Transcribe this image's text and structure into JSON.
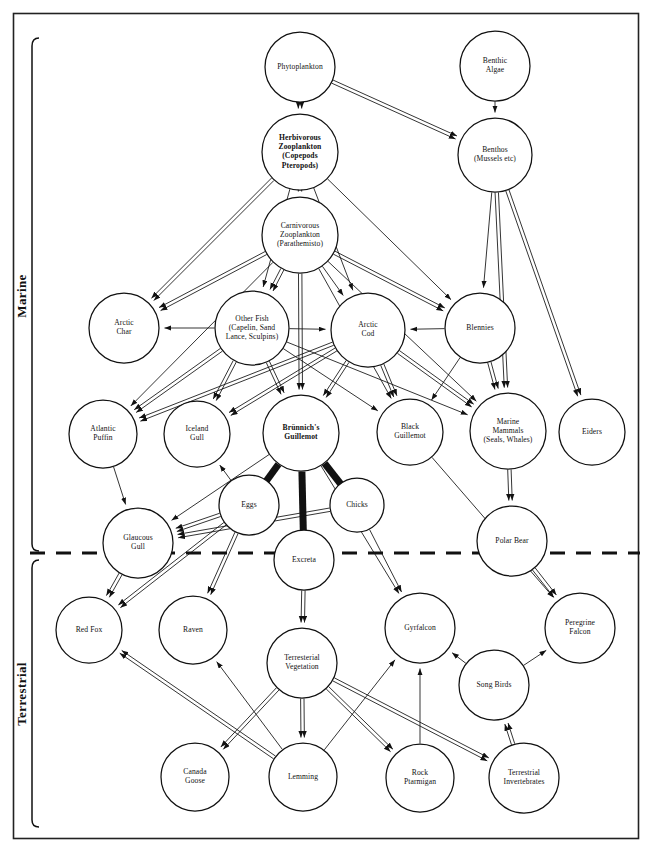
{
  "diagram": {
    "zones": [
      {
        "id": "marine",
        "label": "Marine"
      },
      {
        "id": "terrestrial",
        "label": "Terrestrial"
      }
    ],
    "divider_label": "",
    "colors": {
      "stroke": "#111111",
      "background": "#ffffff",
      "frame": "#222222"
    }
  },
  "nodes": [
    {
      "id": "phytoplankton",
      "label": "Phytoplankton",
      "lines": [
        "Phytoplankton"
      ],
      "cx": 300,
      "cy": 67,
      "r": 35,
      "zone": "marine",
      "bold": false
    },
    {
      "id": "benthic-algae",
      "label": "Benthic Algae",
      "lines": [
        "Benthic",
        "Algae"
      ],
      "cx": 495,
      "cy": 66,
      "r": 35,
      "zone": "marine",
      "bold": false
    },
    {
      "id": "herbivorous-zooplankton",
      "label": "Herbivorous Zooplankton (Copepods Pteropods)",
      "lines": [
        "Herbivorous",
        "Zooplankton",
        "(Copepods",
        "Pteropods)"
      ],
      "cx": 300,
      "cy": 152,
      "r": 38,
      "zone": "marine",
      "bold": true
    },
    {
      "id": "benthos",
      "label": "Benthos (Mussels etc)",
      "lines": [
        "Benthos",
        "(Mussels etc)"
      ],
      "cx": 495,
      "cy": 155,
      "r": 37,
      "zone": "marine",
      "bold": false
    },
    {
      "id": "carnivorous-zooplankton",
      "label": "Carnivorous Zooplankton (Parathemisto)",
      "lines": [
        "Carnivorous",
        "Zooplankton",
        "(Parathemisto)"
      ],
      "cx": 300,
      "cy": 235,
      "r": 38,
      "zone": "marine",
      "bold": false
    },
    {
      "id": "arctic-char",
      "label": "Arctic Char",
      "lines": [
        "Arctic",
        "Char"
      ],
      "cx": 124,
      "cy": 328,
      "r": 35,
      "zone": "marine",
      "bold": false
    },
    {
      "id": "other-fish",
      "label": "Other Fish (Capelin, Sand Lance, Sculpins)",
      "lines": [
        "Other Fish",
        "(Capelin, Sand",
        "Lance, Sculpins)"
      ],
      "cx": 252,
      "cy": 328,
      "r": 37,
      "zone": "marine",
      "bold": false
    },
    {
      "id": "arctic-cod",
      "label": "Arctic Cod",
      "lines": [
        "Arctic",
        "Cod"
      ],
      "cx": 368,
      "cy": 330,
      "r": 37,
      "zone": "marine",
      "bold": false
    },
    {
      "id": "blennies",
      "label": "Blennies",
      "lines": [
        "Blennies"
      ],
      "cx": 480,
      "cy": 328,
      "r": 35,
      "zone": "marine",
      "bold": false
    },
    {
      "id": "atlantic-puffin",
      "label": "Atlantic Puffin",
      "lines": [
        "Atlantic",
        "Puffin"
      ],
      "cx": 103,
      "cy": 434,
      "r": 34,
      "zone": "marine",
      "bold": false
    },
    {
      "id": "iceland-gull",
      "label": "Iceland Gull",
      "lines": [
        "Iceland",
        "Gull"
      ],
      "cx": 197,
      "cy": 434,
      "r": 33,
      "zone": "marine",
      "bold": false
    },
    {
      "id": "brunnichs-guillemot",
      "label": "Brünnich's Guillemot",
      "lines": [
        "Brünnich's",
        "Guillemot"
      ],
      "cx": 301,
      "cy": 433,
      "r": 38,
      "zone": "marine",
      "bold": true
    },
    {
      "id": "black-guillemot",
      "label": "Black Guillemot",
      "lines": [
        "Black",
        "Guillemot"
      ],
      "cx": 410,
      "cy": 432,
      "r": 33,
      "zone": "marine",
      "bold": false
    },
    {
      "id": "marine-mammals",
      "label": "Marine Mammals (Seals, Whales)",
      "lines": [
        "Marine",
        "Mammals",
        "(Seals, Whales)"
      ],
      "cx": 508,
      "cy": 431,
      "r": 38,
      "zone": "marine",
      "bold": false
    },
    {
      "id": "eiders",
      "label": "Eiders",
      "lines": [
        "Eiders"
      ],
      "cx": 592,
      "cy": 432,
      "r": 33,
      "zone": "marine",
      "bold": false
    },
    {
      "id": "eggs",
      "label": "Eggs",
      "lines": [
        "Eggs"
      ],
      "cx": 249,
      "cy": 505,
      "r": 30,
      "zone": "marine",
      "bold": false
    },
    {
      "id": "chicks",
      "label": "Chicks",
      "lines": [
        "Chicks"
      ],
      "cx": 357,
      "cy": 505,
      "r": 27,
      "zone": "marine",
      "bold": false
    },
    {
      "id": "glaucous-gull",
      "label": "Glaucous Gull",
      "lines": [
        "Glaucous",
        "Gull"
      ],
      "cx": 138,
      "cy": 543,
      "r": 35,
      "zone": "marine",
      "bold": false
    },
    {
      "id": "polar-bear",
      "label": "Polar Bear",
      "lines": [
        "Polar Bear"
      ],
      "cx": 512,
      "cy": 541,
      "r": 35,
      "zone": "marine",
      "bold": false
    },
    {
      "id": "excreta",
      "label": "Excreta",
      "lines": [
        "Excreta"
      ],
      "cx": 304,
      "cy": 560,
      "r": 30,
      "zone": "marine",
      "bold": false
    },
    {
      "id": "red-fox",
      "label": "Red Fox",
      "lines": [
        "Red Fox"
      ],
      "cx": 89,
      "cy": 630,
      "r": 33,
      "zone": "terrestrial",
      "bold": false
    },
    {
      "id": "raven",
      "label": "Raven",
      "lines": [
        "Raven"
      ],
      "cx": 193,
      "cy": 630,
      "r": 34,
      "zone": "terrestrial",
      "bold": false
    },
    {
      "id": "gyrfalcon",
      "label": "Gyrfalcon",
      "lines": [
        "Gyrfalcon"
      ],
      "cx": 420,
      "cy": 628,
      "r": 35,
      "zone": "terrestrial",
      "bold": false
    },
    {
      "id": "peregrine-falcon",
      "label": "Peregrine Falcon",
      "lines": [
        "Peregrine",
        "Falcon"
      ],
      "cx": 580,
      "cy": 628,
      "r": 35,
      "zone": "terrestrial",
      "bold": false
    },
    {
      "id": "terresterial-vegetation",
      "label": "Terresterial Vegetation",
      "lines": [
        "Terresterial",
        "Vegetation"
      ],
      "cx": 302,
      "cy": 663,
      "r": 35,
      "zone": "terrestrial",
      "bold": false
    },
    {
      "id": "song-birds",
      "label": "Song Birds",
      "lines": [
        "Song Birds"
      ],
      "cx": 494,
      "cy": 685,
      "r": 35,
      "zone": "terrestrial",
      "bold": false
    },
    {
      "id": "canada-goose",
      "label": "Canada Goose",
      "lines": [
        "Canada",
        "Goose"
      ],
      "cx": 195,
      "cy": 777,
      "r": 34,
      "zone": "terrestrial",
      "bold": false
    },
    {
      "id": "lemming",
      "label": "Lemming",
      "lines": [
        "Lemming"
      ],
      "cx": 303,
      "cy": 777,
      "r": 34,
      "zone": "terrestrial",
      "bold": false
    },
    {
      "id": "rock-ptarmigan",
      "label": "Rock Ptarmigan",
      "lines": [
        "Rock",
        "Ptarmigan"
      ],
      "cx": 420,
      "cy": 778,
      "r": 34,
      "zone": "terrestrial",
      "bold": false
    },
    {
      "id": "terrestrial-invertebrates",
      "label": "Terrestrial Invertebrates",
      "lines": [
        "Terrestrial",
        "Invertebrates"
      ],
      "cx": 524,
      "cy": 778,
      "r": 35,
      "zone": "terrestrial",
      "bold": false
    }
  ],
  "edges": [
    {
      "from": "phytoplankton",
      "to": "herbivorous-zooplankton",
      "style": "double"
    },
    {
      "from": "phytoplankton",
      "to": "benthos",
      "style": "double"
    },
    {
      "from": "benthic-algae",
      "to": "benthos",
      "style": "single"
    },
    {
      "from": "herbivorous-zooplankton",
      "to": "carnivorous-zooplankton",
      "style": "double"
    },
    {
      "from": "herbivorous-zooplankton",
      "to": "arctic-char",
      "style": "double"
    },
    {
      "from": "herbivorous-zooplankton",
      "to": "other-fish",
      "style": "single"
    },
    {
      "from": "herbivorous-zooplankton",
      "to": "arctic-cod",
      "style": "single"
    },
    {
      "from": "herbivorous-zooplankton",
      "to": "blennies",
      "style": "single"
    },
    {
      "from": "benthos",
      "to": "blennies",
      "style": "single"
    },
    {
      "from": "benthos",
      "to": "marine-mammals",
      "style": "double"
    },
    {
      "from": "benthos",
      "to": "eiders",
      "style": "double"
    },
    {
      "from": "carnivorous-zooplankton",
      "to": "arctic-char",
      "style": "double"
    },
    {
      "from": "carnivorous-zooplankton",
      "to": "other-fish",
      "style": "double"
    },
    {
      "from": "carnivorous-zooplankton",
      "to": "arctic-cod",
      "style": "single"
    },
    {
      "from": "carnivorous-zooplankton",
      "to": "blennies",
      "style": "double"
    },
    {
      "from": "carnivorous-zooplankton",
      "to": "brunnichs-guillemot",
      "style": "double"
    },
    {
      "from": "carnivorous-zooplankton",
      "to": "black-guillemot",
      "style": "single"
    },
    {
      "from": "carnivorous-zooplankton",
      "to": "atlantic-puffin",
      "style": "single"
    },
    {
      "from": "carnivorous-zooplankton",
      "to": "marine-mammals",
      "style": "single"
    },
    {
      "from": "other-fish",
      "to": "arctic-char",
      "style": "single"
    },
    {
      "from": "other-fish",
      "to": "arctic-cod",
      "style": "single"
    },
    {
      "from": "blennies",
      "to": "arctic-cod",
      "style": "single"
    },
    {
      "from": "other-fish",
      "to": "atlantic-puffin",
      "style": "double"
    },
    {
      "from": "other-fish",
      "to": "iceland-gull",
      "style": "double"
    },
    {
      "from": "other-fish",
      "to": "brunnichs-guillemot",
      "style": "double"
    },
    {
      "from": "other-fish",
      "to": "black-guillemot",
      "style": "single"
    },
    {
      "from": "other-fish",
      "to": "marine-mammals",
      "style": "single"
    },
    {
      "from": "arctic-cod",
      "to": "atlantic-puffin",
      "style": "double"
    },
    {
      "from": "arctic-cod",
      "to": "iceland-gull",
      "style": "double"
    },
    {
      "from": "arctic-cod",
      "to": "brunnichs-guillemot",
      "style": "double"
    },
    {
      "from": "arctic-cod",
      "to": "black-guillemot",
      "style": "double"
    },
    {
      "from": "arctic-cod",
      "to": "marine-mammals",
      "style": "double"
    },
    {
      "from": "blennies",
      "to": "black-guillemot",
      "style": "single"
    },
    {
      "from": "blennies",
      "to": "marine-mammals",
      "style": "double"
    },
    {
      "from": "brunnichs-guillemot",
      "to": "eggs",
      "style": "thick"
    },
    {
      "from": "brunnichs-guillemot",
      "to": "chicks",
      "style": "thick"
    },
    {
      "from": "brunnichs-guillemot",
      "to": "excreta",
      "style": "thick"
    },
    {
      "from": "brunnichs-guillemot",
      "to": "glaucous-gull",
      "style": "single"
    },
    {
      "from": "brunnichs-guillemot",
      "to": "gyrfalcon",
      "style": "single"
    },
    {
      "from": "atlantic-puffin",
      "to": "glaucous-gull",
      "style": "single"
    },
    {
      "from": "eggs",
      "to": "glaucous-gull",
      "style": "double"
    },
    {
      "from": "eggs",
      "to": "iceland-gull",
      "style": "single"
    },
    {
      "from": "eggs",
      "to": "red-fox",
      "style": "double"
    },
    {
      "from": "eggs",
      "to": "raven",
      "style": "double"
    },
    {
      "from": "chicks",
      "to": "glaucous-gull",
      "style": "double"
    },
    {
      "from": "chicks",
      "to": "gyrfalcon",
      "style": "single"
    },
    {
      "from": "glaucous-gull",
      "to": "red-fox",
      "style": "double"
    },
    {
      "from": "marine-mammals",
      "to": "polar-bear",
      "style": "double"
    },
    {
      "from": "black-guillemot",
      "to": "peregrine-falcon",
      "style": "single"
    },
    {
      "from": "polar-bear",
      "to": "peregrine-falcon",
      "style": "double"
    },
    {
      "from": "excreta",
      "to": "terresterial-vegetation",
      "style": "double"
    },
    {
      "from": "terresterial-vegetation",
      "to": "lemming",
      "style": "double"
    },
    {
      "from": "terresterial-vegetation",
      "to": "canada-goose",
      "style": "double"
    },
    {
      "from": "terresterial-vegetation",
      "to": "rock-ptarmigan",
      "style": "double"
    },
    {
      "from": "terresterial-vegetation",
      "to": "terrestrial-invertebrates",
      "style": "double"
    },
    {
      "from": "lemming",
      "to": "red-fox",
      "style": "double"
    },
    {
      "from": "lemming",
      "to": "raven",
      "style": "single"
    },
    {
      "from": "lemming",
      "to": "gyrfalcon",
      "style": "single"
    },
    {
      "from": "rock-ptarmigan",
      "to": "gyrfalcon",
      "style": "single"
    },
    {
      "from": "song-birds",
      "to": "gyrfalcon",
      "style": "single"
    },
    {
      "from": "song-birds",
      "to": "peregrine-falcon",
      "style": "single"
    },
    {
      "from": "terrestrial-invertebrates",
      "to": "song-birds",
      "style": "double"
    }
  ]
}
